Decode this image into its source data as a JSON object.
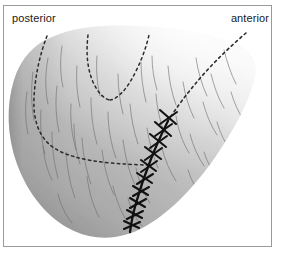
{
  "figure": {
    "domain": "anatomical-illustration",
    "frame": {
      "border_color": "#9a9a9a",
      "background_color": "#ffffff"
    }
  },
  "labels": {
    "posterior": "posterior",
    "anterior": "anterior"
  },
  "colors": {
    "text": "#1a1a1a",
    "frame_border": "#9a9a9a",
    "scalp_light": "#f2f2f2",
    "scalp_mid": "#b8b8b8",
    "scalp_dark": "#8f8f8f",
    "incision_dashed": "#2b2b2b",
    "suture_line": "#111111",
    "hair_strand": "#6e6e6e"
  },
  "elements": {
    "scalp_surface": "shaded rounded scalp dome",
    "dashed_incision_left": "dashed curve descending on posterior side",
    "dashed_incision_v": "dashed V-shaped midline incision marking",
    "dashed_incision_right": "dashed curve descending from anterior apex",
    "suture_line": "sutured closure line with cross stitches",
    "hair_strands": "fine hair strands across scalp surface"
  },
  "suture": {
    "stitch_count": 12,
    "style": "cross-stitch"
  }
}
